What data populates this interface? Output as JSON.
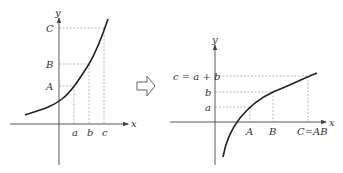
{
  "left_graph": {
    "axis_x_label": "x",
    "axis_y_label": "y",
    "y_labels": {
      "C": "C",
      "B": "B",
      "A": "A"
    },
    "x_labels": {
      "a": "a",
      "b": "b",
      "c": "c"
    },
    "curve": "increasing convex (exponential-like)"
  },
  "arrow": {
    "icon": "hollow-right-arrow"
  },
  "right_graph": {
    "axis_x_label": "x",
    "axis_y_label": "y",
    "y_labels": {
      "c": "c = a + b",
      "b": "b",
      "a": "a"
    },
    "x_labels": {
      "A": "A",
      "B": "B",
      "C": "C=AB"
    },
    "curve": "increasing concave (logarithmic-like)"
  }
}
